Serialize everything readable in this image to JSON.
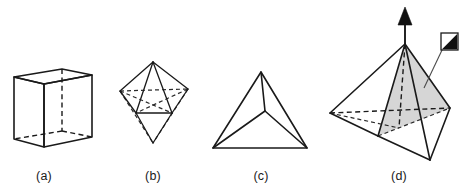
{
  "figure": {
    "background_color": "#ffffff",
    "line_color": "#1a1a1a",
    "shade_color": "#d2d2d2",
    "width": 466,
    "height": 196,
    "panels": [
      {
        "key": "a",
        "caption": "(a)",
        "caption_x": 44,
        "caption_y": 180,
        "shape_name": "cube",
        "description": "Cube drawn in oblique projection with hidden edges dashed",
        "has_hidden_edges": true,
        "has_shaded_plane": false,
        "has_axis_arrow": false
      },
      {
        "key": "b",
        "caption": "(b)",
        "caption_x": 153,
        "caption_y": 180,
        "shape_name": "octahedron",
        "description": "Octahedron with top and bottom apices and dashed hidden edges",
        "has_hidden_edges": true,
        "has_shaded_plane": false,
        "has_axis_arrow": false
      },
      {
        "key": "c",
        "caption": "(c)",
        "caption_x": 261,
        "caption_y": 180,
        "shape_name": "tetrahedron",
        "description": "Tetrahedron seen from above, central vertex joined to three outer vertices",
        "has_hidden_edges": false,
        "has_shaded_plane": false,
        "has_axis_arrow": false
      },
      {
        "key": "d",
        "caption": "(d)",
        "caption_x": 399,
        "caption_y": 180,
        "shape_name": "tetrahedron-with-mirror-plane",
        "description": "Tetrahedron with shaded mirror plane through apex and rotation axis arrow",
        "has_hidden_edges": true,
        "has_shaded_plane": true,
        "has_axis_arrow": true,
        "symbol_label": "mirror-plane-symbol"
      }
    ]
  }
}
